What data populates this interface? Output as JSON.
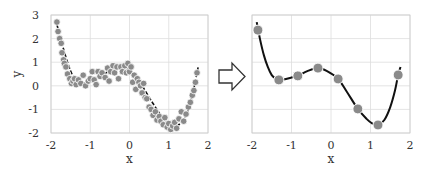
{
  "colors": {
    "point": "#8a8a8a",
    "point_outline": "#ffffff",
    "curve": "#111111",
    "grid": "#dddddd",
    "frame": "#cccccc",
    "arrow": "#333333"
  },
  "chart_data": [
    {
      "type": "scatter",
      "title": "",
      "xlabel": "x",
      "ylabel": "y",
      "xlim": [
        -2,
        2
      ],
      "ylim": [
        -2,
        3
      ],
      "xticks": [
        "-2",
        "-1",
        "0",
        "1",
        "2"
      ],
      "yticks": [
        "-2",
        "-1",
        "0",
        "1",
        "2",
        "3"
      ],
      "grid": true,
      "series": [
        {
          "name": "noisy samples",
          "x": [
            -1.85,
            -1.82,
            -1.78,
            -1.74,
            -1.72,
            -1.68,
            -1.66,
            -1.62,
            -1.58,
            -1.52,
            -1.48,
            -1.44,
            -1.4,
            -1.36,
            -1.3,
            -1.24,
            -1.18,
            -1.12,
            -1.05,
            -1.0,
            -0.95,
            -0.9,
            -0.85,
            -0.8,
            -0.75,
            -0.7,
            -0.62,
            -0.56,
            -0.52,
            -0.48,
            -0.42,
            -0.38,
            -0.32,
            -0.28,
            -0.22,
            -0.18,
            -0.12,
            -0.08,
            -0.04,
            0.0,
            0.04,
            0.08,
            0.12,
            0.16,
            0.2,
            0.24,
            0.28,
            0.32,
            0.36,
            0.4,
            0.44,
            0.5,
            0.55,
            0.6,
            0.66,
            0.7,
            0.76,
            0.8,
            0.86,
            0.9,
            0.96,
            1.0,
            1.05,
            1.1,
            1.15,
            1.2,
            1.26,
            1.32,
            1.38,
            1.44,
            1.5,
            1.55,
            1.6,
            1.64,
            1.68,
            1.72
          ],
          "y": [
            2.7,
            2.3,
            2.0,
            1.8,
            1.4,
            1.1,
            0.95,
            0.8,
            0.5,
            0.3,
            0.1,
            0.2,
            0.3,
            0.05,
            0.25,
            0.1,
            0.45,
            0.0,
            0.2,
            0.3,
            0.6,
            0.25,
            0.05,
            0.6,
            0.4,
            0.55,
            0.35,
            0.75,
            0.2,
            0.6,
            0.85,
            0.55,
            0.8,
            0.3,
            0.8,
            0.6,
            0.85,
            0.55,
            0.95,
            0.6,
            0.8,
            0.15,
            0.45,
            -0.15,
            0.3,
            0.15,
            0.0,
            -0.3,
            0.1,
            -0.5,
            -0.55,
            -0.9,
            -1.0,
            -1.25,
            -1.1,
            -1.45,
            -1.3,
            -1.5,
            -1.65,
            -1.35,
            -1.75,
            -1.6,
            -1.85,
            -1.7,
            -1.55,
            -1.8,
            -1.4,
            -1.1,
            -1.5,
            -1.2,
            -0.9,
            -0.7,
            -0.4,
            -0.2,
            0.15,
            0.55
          ]
        },
        {
          "name": "fit curve",
          "style": "dashed",
          "x": [
            -1.85,
            -1.6,
            -1.4,
            -1.2,
            -1.0,
            -0.6,
            -0.3,
            0.0,
            0.3,
            0.6,
            0.9,
            1.2,
            1.45,
            1.6,
            1.75
          ],
          "y": [
            2.6,
            1.1,
            0.3,
            0.12,
            0.2,
            0.55,
            0.75,
            0.65,
            0.05,
            -0.75,
            -1.45,
            -1.7,
            -1.2,
            -0.4,
            0.8
          ]
        }
      ]
    },
    {
      "type": "line",
      "title": "",
      "xlabel": "x",
      "ylabel": "",
      "xlim": [
        -2,
        2
      ],
      "ylim": [
        -2,
        3
      ],
      "xticks": [
        "-2",
        "-1",
        "0",
        "1",
        "2"
      ],
      "yticks": [],
      "grid": true,
      "series": [
        {
          "name": "selected points",
          "x": [
            -1.85,
            -1.32,
            -0.84,
            -0.33,
            0.18,
            0.68,
            1.19,
            1.7
          ],
          "y": [
            2.36,
            0.25,
            0.42,
            0.75,
            0.29,
            -0.98,
            -1.66,
            0.46
          ]
        },
        {
          "name": "smooth curve",
          "x": [
            -1.88,
            -1.8,
            -1.7,
            -1.6,
            -1.5,
            -1.4,
            -1.32,
            -1.2,
            -1.0,
            -0.84,
            -0.6,
            -0.33,
            -0.1,
            0.18,
            0.4,
            0.68,
            0.9,
            1.05,
            1.19,
            1.35,
            1.5,
            1.62,
            1.7,
            1.76
          ],
          "y": [
            2.7,
            2.0,
            1.3,
            0.8,
            0.45,
            0.3,
            0.25,
            0.27,
            0.35,
            0.42,
            0.62,
            0.75,
            0.62,
            0.29,
            -0.25,
            -0.98,
            -1.4,
            -1.6,
            -1.66,
            -1.45,
            -0.9,
            -0.2,
            0.46,
            0.8
          ]
        }
      ]
    }
  ],
  "arrow": {
    "direction": "right",
    "style": "outline"
  }
}
